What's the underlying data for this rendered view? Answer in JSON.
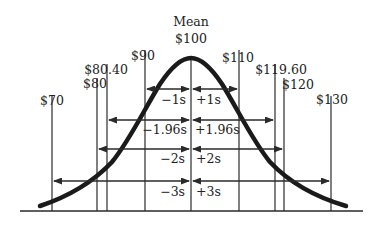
{
  "diagram": {
    "mean_label": "Mean",
    "mean_value": "$100",
    "values": [
      {
        "label": "$70",
        "x": 52,
        "top": 96
      },
      {
        "label": "$80",
        "x": 97,
        "top": 78
      },
      {
        "label": "$80.40",
        "x": 107,
        "top": 64
      },
      {
        "label": "$90",
        "x": 145,
        "top": 50
      },
      {
        "label": "$110",
        "x": 239,
        "top": 50
      },
      {
        "label": "$119.60",
        "x": 275,
        "top": 64
      },
      {
        "label": "$120",
        "x": 284,
        "top": 78
      },
      {
        "label": "$130",
        "x": 331,
        "top": 96
      }
    ],
    "intervals": [
      {
        "neg_label": "−1s",
        "pos_label": "+1s",
        "left_x": 145,
        "right_x": 239,
        "y": 89
      },
      {
        "neg_label": "−1.96s",
        "pos_label": "+1.96s",
        "left_x": 107,
        "right_x": 275,
        "y": 120
      },
      {
        "neg_label": "−2s",
        "pos_label": "+2s",
        "left_x": 97,
        "right_x": 284,
        "y": 149
      },
      {
        "neg_label": "−3s",
        "pos_label": "+3s",
        "left_x": 52,
        "right_x": 331,
        "y": 181
      }
    ],
    "colors": {
      "ink": "#222222",
      "background": "#ffffff"
    }
  }
}
